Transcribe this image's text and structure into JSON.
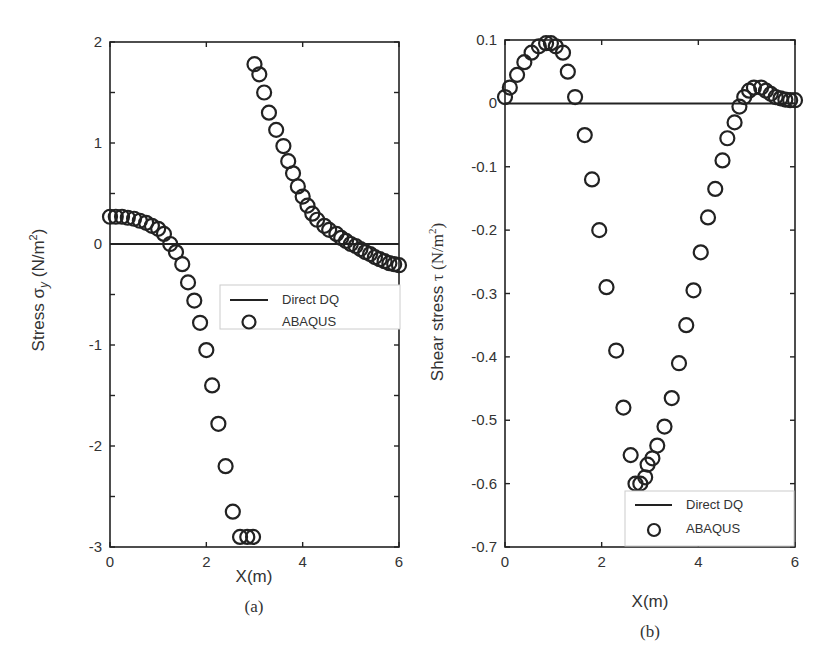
{
  "chart_data": [
    {
      "type": "scatter",
      "panel_label": "(a)",
      "title": "",
      "xlabel": "X(m)",
      "ylabel": "Stress σy (N/m²)",
      "ylabel_parts": {
        "prefix": "Stress ",
        "symbol": "σ",
        "sub": "y",
        "unit_pre": " (N/m",
        "sup": "2",
        "unit_post": ")"
      },
      "xlim": [
        0,
        6
      ],
      "ylim": [
        -3,
        2
      ],
      "xticks": [
        0,
        2,
        4,
        6
      ],
      "yticks": [
        -3,
        -2,
        -1,
        0,
        1,
        2
      ],
      "grid": false,
      "legend": {
        "position": "center-right",
        "entries": [
          "Direct DQ",
          "ABAQUS"
        ]
      },
      "series": [
        {
          "name": "Direct DQ",
          "style": "line",
          "x": [
            0,
            6
          ],
          "y": [
            0,
            0
          ]
        },
        {
          "name": "ABAQUS",
          "style": "open-circle",
          "x": [
            0.0,
            0.12,
            0.25,
            0.37,
            0.5,
            0.62,
            0.75,
            0.87,
            1.0,
            1.12,
            1.25,
            1.37,
            1.5,
            1.62,
            1.75,
            1.87,
            2.0,
            2.12,
            2.25,
            2.4,
            2.55,
            2.7,
            2.85,
            2.97,
            3.0,
            3.1,
            3.2,
            3.3,
            3.45,
            3.6,
            3.7,
            3.8,
            3.9,
            4.0,
            4.1,
            4.2,
            4.3,
            4.45,
            4.55,
            4.7,
            4.8,
            4.9,
            5.0,
            5.1,
            5.2,
            5.3,
            5.4,
            5.5,
            5.6,
            5.7,
            5.8,
            5.9,
            6.0
          ],
          "y": [
            0.27,
            0.27,
            0.27,
            0.26,
            0.25,
            0.23,
            0.21,
            0.18,
            0.15,
            0.1,
            0.0,
            -0.08,
            -0.2,
            -0.38,
            -0.56,
            -0.78,
            -1.05,
            -1.4,
            -1.78,
            -2.2,
            -2.65,
            -2.9,
            -2.9,
            -2.9,
            1.78,
            1.68,
            1.5,
            1.3,
            1.13,
            0.97,
            0.82,
            0.7,
            0.57,
            0.47,
            0.38,
            0.3,
            0.24,
            0.18,
            0.14,
            0.1,
            0.06,
            0.03,
            0.0,
            -0.02,
            -0.05,
            -0.08,
            -0.1,
            -0.13,
            -0.15,
            -0.17,
            -0.19,
            -0.2,
            -0.21
          ]
        }
      ]
    },
    {
      "type": "scatter",
      "panel_label": "(b)",
      "title": "",
      "xlabel": "X(m)",
      "ylabel": "Shear stress τ (N/m²)",
      "ylabel_parts": {
        "prefix": "Shear stress ",
        "symbol": "τ",
        "unit_pre": " (N/m",
        "sup": "2",
        "unit_post": ")"
      },
      "xlim": [
        0,
        6
      ],
      "ylim": [
        -0.7,
        0.1
      ],
      "xticks": [
        0,
        2,
        4,
        6
      ],
      "yticks": [
        -0.7,
        -0.6,
        -0.5,
        -0.4,
        -0.3,
        -0.2,
        -0.1,
        0,
        0.1
      ],
      "grid": false,
      "legend": {
        "position": "lower-right",
        "entries": [
          "Direct DQ",
          "ABAQUS"
        ]
      },
      "series": [
        {
          "name": "Direct DQ",
          "style": "line",
          "x": [
            0,
            6
          ],
          "y": [
            0,
            0
          ]
        },
        {
          "name": "ABAQUS",
          "style": "open-circle",
          "x": [
            0.0,
            0.1,
            0.25,
            0.4,
            0.55,
            0.7,
            0.85,
            0.95,
            1.05,
            1.2,
            1.3,
            1.45,
            1.65,
            1.8,
            1.95,
            2.1,
            2.3,
            2.45,
            2.6,
            2.7,
            2.8,
            2.9,
            2.95,
            3.05,
            3.15,
            3.3,
            3.45,
            3.6,
            3.75,
            3.9,
            4.05,
            4.2,
            4.35,
            4.5,
            4.6,
            4.75,
            4.85,
            4.95,
            5.05,
            5.15,
            5.3,
            5.4,
            5.5,
            5.6,
            5.7,
            5.8,
            5.9,
            6.0
          ],
          "y": [
            0.01,
            0.025,
            0.045,
            0.065,
            0.08,
            0.09,
            0.095,
            0.095,
            0.09,
            0.08,
            0.05,
            0.01,
            -0.05,
            -0.12,
            -0.2,
            -0.29,
            -0.39,
            -0.48,
            -0.555,
            -0.6,
            -0.6,
            -0.59,
            -0.57,
            -0.56,
            -0.54,
            -0.51,
            -0.465,
            -0.41,
            -0.35,
            -0.295,
            -0.235,
            -0.18,
            -0.135,
            -0.09,
            -0.055,
            -0.03,
            -0.005,
            0.01,
            0.02,
            0.025,
            0.025,
            0.02,
            0.015,
            0.01,
            0.008,
            0.006,
            0.005,
            0.005
          ]
        }
      ]
    }
  ],
  "figure": {
    "captions": [
      "(a)",
      "(b)"
    ]
  }
}
